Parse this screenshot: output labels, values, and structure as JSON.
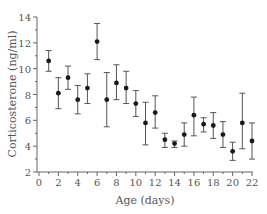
{
  "chart_data": {
    "type": "scatter",
    "title": "",
    "xlabel": "Age (days)",
    "ylabel": "Corticosterone (ng/ml)",
    "xlim": [
      0,
      22
    ],
    "ylim": [
      2,
      14
    ],
    "xticks": [
      0,
      2,
      4,
      6,
      8,
      10,
      12,
      14,
      16,
      18,
      20,
      22
    ],
    "yticks": [
      2,
      4,
      6,
      8,
      10,
      12,
      14
    ],
    "grid": false,
    "legend": null,
    "error_bars": true,
    "series": [
      {
        "name": "Corticosterone",
        "x": [
          1,
          2,
          3,
          4,
          5,
          6,
          7,
          8,
          9,
          10,
          11,
          12,
          13,
          14,
          15,
          16,
          17,
          18,
          19,
          20,
          21,
          22
        ],
        "y": [
          10.6,
          8.1,
          9.3,
          7.6,
          8.5,
          12.1,
          7.6,
          8.9,
          8.5,
          7.3,
          5.8,
          6.6,
          4.5,
          4.2,
          4.9,
          6.4,
          5.7,
          5.6,
          4.9,
          3.6,
          5.8,
          4.4
        ],
        "y_err_high": [
          11.4,
          9.3,
          10.2,
          8.7,
          9.6,
          13.5,
          9.7,
          10.3,
          9.8,
          8.3,
          7.4,
          7.9,
          5.0,
          4.4,
          5.8,
          7.8,
          6.2,
          6.6,
          5.9,
          4.3,
          8.1,
          5.8
        ],
        "y_err_low": [
          9.8,
          6.9,
          8.4,
          6.5,
          7.3,
          10.7,
          5.5,
          7.6,
          7.3,
          6.3,
          4.1,
          5.4,
          3.9,
          3.9,
          4.0,
          4.8,
          5.1,
          4.6,
          3.9,
          2.9,
          3.8,
          3.0
        ]
      }
    ]
  },
  "colors": {
    "axis": "#666666",
    "marker": "#1a1a1a",
    "errorbar": "#555555",
    "text": "#555555"
  }
}
